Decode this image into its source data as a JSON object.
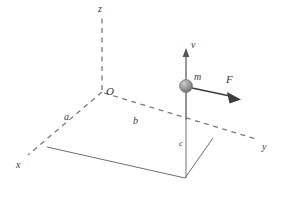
{
  "figure": {
    "type": "3d-coordinate-diagram",
    "background_color": "#ffffff",
    "line_color": "#6e6e6e",
    "label_color": "#3a3a3a",
    "sphere_color": "#9a9a9a",
    "axes": [
      {
        "key": "z",
        "label": "z",
        "style": "dashed",
        "label_x": 98,
        "label_y": 4
      },
      {
        "key": "x",
        "label": "x",
        "style": "dashed",
        "label_x": 16,
        "label_y": 160
      },
      {
        "key": "y",
        "label": "y",
        "style": "dashed",
        "label_x": 262,
        "label_y": 142
      }
    ],
    "origin": {
      "label": "O",
      "x": 106,
      "y": 86
    },
    "distances": [
      {
        "key": "a",
        "label": "a",
        "x": 64,
        "y": 112,
        "size": "md"
      },
      {
        "key": "b",
        "label": "b",
        "x": 133,
        "y": 116,
        "size": "md"
      },
      {
        "key": "c",
        "label": "c",
        "x": 179,
        "y": 139,
        "size": "sm"
      }
    ],
    "particle": {
      "label": "m",
      "label_x": 194,
      "label_y": 72,
      "center_x": 186,
      "center_y": 86,
      "radius": 6.5
    },
    "vectors": [
      {
        "key": "v",
        "label": "v",
        "label_x": 191,
        "label_y": 40,
        "direction": "up"
      },
      {
        "key": "F",
        "label": "F",
        "label_x": 226,
        "label_y": 74,
        "direction": "right-down"
      }
    ]
  }
}
